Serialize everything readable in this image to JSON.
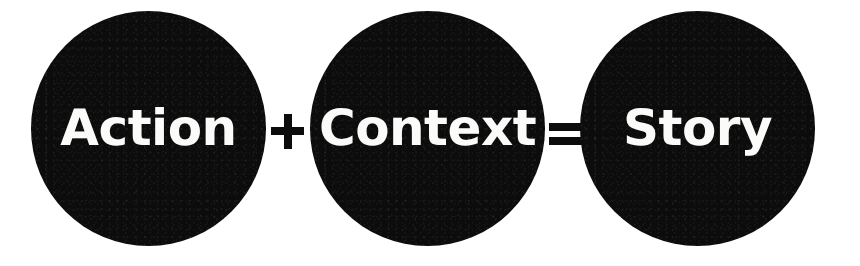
{
  "canvas": {
    "width": 860,
    "height": 266,
    "background_color": "#ffffff"
  },
  "theme": {
    "circle_fill": "#0d0c0c",
    "label_color": "#fbfbfa",
    "operator_color": "#0d0c0c"
  },
  "equation": {
    "full_text": "Action + Context = Story",
    "terms": [
      {
        "label": "Action",
        "shape": "circle",
        "icon": "circle-shape"
      },
      {
        "label": "Context",
        "shape": "circle",
        "icon": "circle-shape"
      },
      {
        "label": "Story",
        "shape": "circle",
        "icon": "circle-shape"
      }
    ],
    "operators": [
      {
        "symbol": "+",
        "icon": "plus-icon",
        "name": "plus-operator"
      },
      {
        "symbol": "=",
        "icon": "equals-icon",
        "name": "equals-operator"
      }
    ]
  }
}
